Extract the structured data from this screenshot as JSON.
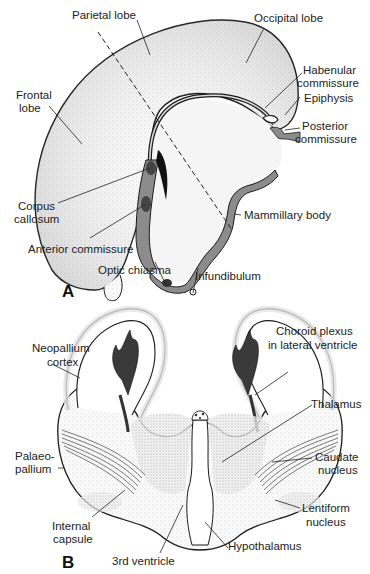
{
  "figure": {
    "panels": [
      {
        "id": "A",
        "letter": "A",
        "view": "Medial sagittal view of brain",
        "labels": {
          "parietal_lobe": "Parietal lobe",
          "occipital_lobe": "Occipital lobe",
          "frontal_lobe_1": "Frontal",
          "frontal_lobe_2": "lobe",
          "habenular_1": "Habenular",
          "habenular_2": "commissure",
          "epiphysis": "Epiphysis",
          "posterior_1": "Posterior",
          "posterior_2": "commissure",
          "corpus_1": "Corpus",
          "corpus_2": "callosum",
          "mammillary_body": "Mammillary body",
          "anterior_commissure": "Anterior commissure",
          "optic_chiasma": "Optic chiasma",
          "infundibulum": "Infundibulum"
        }
      },
      {
        "id": "B",
        "letter": "B",
        "view": "Coronal section of forebrain",
        "labels": {
          "neopallium_1": "Neopallium",
          "neopallium_2": "cortex",
          "choroid_1": "Choroid plexus",
          "choroid_2": "in lateral ventricle",
          "thalamus": "Thalamus",
          "palaeo_1": "Palaeo-",
          "palaeo_2": "pallium",
          "caudate_1": "Caudate",
          "caudate_2": "nucleus",
          "internal_1": "Internal",
          "internal_2": "capsule",
          "lentiform_1": "Lentiform",
          "lentiform_2": "nucleus",
          "third_ventricle": "3rd ventricle",
          "hypothalamus": "Hypothalamus"
        }
      }
    ],
    "colors": {
      "ink": "#1a1a1a",
      "gray_fill": "#8c8c8c",
      "stipple": "#d9d9d9",
      "dark_plexus": "#3a3a3a"
    }
  }
}
